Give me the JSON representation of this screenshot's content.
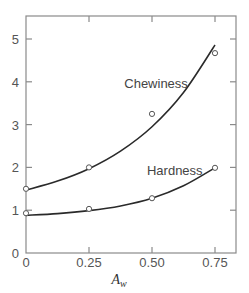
{
  "chart_data": {
    "type": "line",
    "title": "",
    "xlabel": "A",
    "xlabel_subscript": "w",
    "ylabel": "",
    "xlim": [
      0,
      0.8
    ],
    "ylim": [
      0,
      5.5
    ],
    "grid": false,
    "legend": "inline labels",
    "x_ticks": [
      0,
      0.25,
      0.5,
      0.75
    ],
    "x_tick_labels": [
      "0",
      "0.25",
      "0.50",
      "0.75"
    ],
    "y_ticks": [
      0,
      1,
      2,
      3,
      4,
      5
    ],
    "y_tick_labels": [
      "0",
      "1",
      "2",
      "3",
      "4",
      "5"
    ],
    "series": [
      {
        "name": "Chewiness",
        "points": [
          [
            0,
            1.5
          ],
          [
            0.25,
            2.0
          ],
          [
            0.5,
            3.25
          ],
          [
            0.75,
            4.67
          ]
        ],
        "fit_curve": [
          [
            0,
            1.47
          ],
          [
            0.125,
            1.68
          ],
          [
            0.25,
            1.97
          ],
          [
            0.375,
            2.38
          ],
          [
            0.5,
            2.95
          ],
          [
            0.625,
            3.75
          ],
          [
            0.75,
            4.86
          ]
        ],
        "label_pos": [
          0.39,
          3.85
        ]
      },
      {
        "name": "Hardness",
        "points": [
          [
            0,
            0.93
          ],
          [
            0.25,
            1.03
          ],
          [
            0.5,
            1.28
          ],
          [
            0.75,
            1.99
          ]
        ],
        "fit_curve": [
          [
            0,
            0.88
          ],
          [
            0.125,
            0.92
          ],
          [
            0.25,
            0.99
          ],
          [
            0.375,
            1.1
          ],
          [
            0.5,
            1.28
          ],
          [
            0.625,
            1.57
          ],
          [
            0.75,
            1.99
          ]
        ],
        "label_pos": [
          0.48,
          1.82
        ]
      }
    ]
  }
}
